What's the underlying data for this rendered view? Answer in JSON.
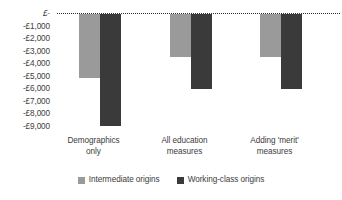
{
  "chart_data": {
    "type": "bar",
    "title": "",
    "subtitle": "",
    "xlabel": "",
    "ylabel": "",
    "categories": [
      "Demographics only",
      "All education measures",
      "Adding 'merit' measures"
    ],
    "category_lines": [
      [
        "Demographics",
        "only"
      ],
      [
        "All education",
        "measures"
      ],
      [
        "Adding 'merit'",
        "measures"
      ]
    ],
    "series": [
      {
        "name": "Intermediate origins",
        "color": "#9a9a9a",
        "values": [
          -5100,
          -3400,
          -3400
        ]
      },
      {
        "name": "Working-class origins",
        "color": "#3a3a3a",
        "values": [
          -8900,
          -6000,
          -6000
        ]
      }
    ],
    "ylim": [
      -9000,
      0
    ],
    "ytick_values": [
      0,
      -1000,
      -2000,
      -3000,
      -4000,
      -5000,
      -6000,
      -7000,
      -8000,
      -9000
    ],
    "ytick_labels": [
      "£-",
      "-£1,000",
      "-£2,000",
      "-£3,000",
      "-£4,000",
      "-£5,000",
      "-£6,000",
      "-£7,000",
      "-£8,000",
      "-£9,000"
    ],
    "grid": false,
    "zero_baseline": true,
    "zero_baseline_style": "dotted",
    "legend": {
      "position": "bottom",
      "entries": [
        {
          "label": "Intermediate origins",
          "color": "#9a9a9a"
        },
        {
          "label": "Working-class origins",
          "color": "#3a3a3a"
        }
      ]
    }
  }
}
